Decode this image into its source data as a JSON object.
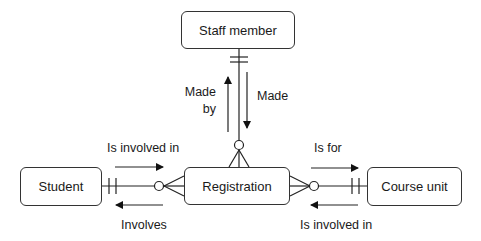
{
  "entities": {
    "staff": {
      "label": "Staff member"
    },
    "student": {
      "label": "Student"
    },
    "registration": {
      "label": "Registration"
    },
    "course": {
      "label": "Course unit"
    }
  },
  "relationships": [
    {
      "from": "Staff member",
      "to": "Registration",
      "from_cardinality": "one-and-only-one",
      "to_cardinality": "zero-or-many",
      "labels": {
        "forward": "Made",
        "backward_line1": "Made",
        "backward_line2": "by"
      }
    },
    {
      "from": "Student",
      "to": "Registration",
      "from_cardinality": "one-and-only-one",
      "to_cardinality": "zero-or-many",
      "labels": {
        "forward": "Is involved in",
        "backward": "Involves"
      }
    },
    {
      "from": "Course unit",
      "to": "Registration",
      "from_cardinality": "one-and-only-one",
      "to_cardinality": "zero-or-many",
      "labels": {
        "forward": "Is for",
        "backward": "Is involved in"
      }
    }
  ],
  "labels": {
    "made_by_1": "Made",
    "made_by_2": "by",
    "made": "Made",
    "student_forward": "Is involved in",
    "student_backward": "Involves",
    "course_forward": "Is for",
    "course_backward": "Is involved in"
  },
  "colors": {
    "line": "#222222",
    "border": "#333333",
    "background": "#ffffff"
  }
}
